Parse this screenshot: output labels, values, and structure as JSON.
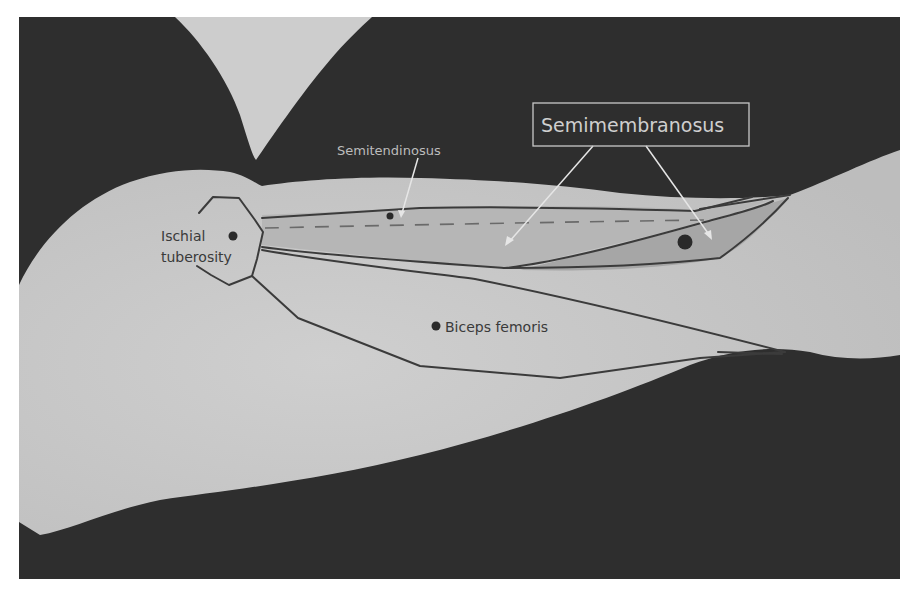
{
  "figure": {
    "type": "anatomical-diagram",
    "colors": {
      "background_dark": "#2e2e2e",
      "limb_fill": "#c9c9c9",
      "upper_limb_fill": "#cdcdcd",
      "muscle_fill_dark": "#a9a9a9",
      "muscle_fill_mid": "#b9b9b9",
      "outline": "#3b3b3b",
      "label_dark": "#3a3a3a",
      "label_light": "#bcbcbc",
      "page_bg": "#ffffff"
    }
  },
  "labels": {
    "ischial_line1": "Ischial",
    "ischial_line2": "tuberosity",
    "semitendinosus": "Semitendinosus",
    "semimembranosus": "Semimembranosus",
    "biceps_femoris": "Biceps femoris"
  },
  "markers": [
    {
      "name": "ischial-tuberosity-point",
      "x": 233,
      "y": 236
    },
    {
      "name": "semitendinosus-point",
      "x": 390,
      "y": 216
    },
    {
      "name": "semimembranosus-point",
      "x": 685,
      "y": 242
    },
    {
      "name": "biceps-femoris-point",
      "x": 436,
      "y": 326
    }
  ]
}
